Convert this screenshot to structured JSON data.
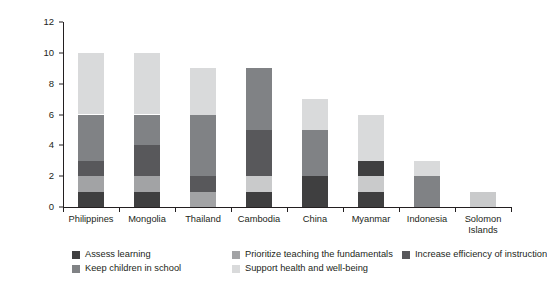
{
  "chart_data": {
    "type": "bar",
    "subtype": "stacked-bar",
    "title": "",
    "xlabel": "",
    "ylabel": "Number of recovery measures, by key area",
    "ylim": [
      0,
      12
    ],
    "yticks": [
      0,
      2,
      4,
      6,
      8,
      10,
      12
    ],
    "grid": false,
    "legend_position": "bottom",
    "categories": [
      "Philippines",
      "Mongolia",
      "Thailand",
      "Cambodia",
      "China",
      "Myanmar",
      "Indonesia",
      "Solomon\nIslands"
    ],
    "series": [
      {
        "name": "Assess learning",
        "color": "#3f3f40",
        "values": [
          1,
          1,
          0,
          1,
          2,
          1,
          0,
          0
        ]
      },
      {
        "name": "Keep children in school",
        "color": "#a2a3a5",
        "values": [
          1,
          1,
          1,
          0,
          0,
          0,
          0,
          0
        ]
      },
      {
        "name": "Prioritize teaching the fundamentals",
        "color": "#c9cacb",
        "values": [
          0,
          0,
          0,
          1,
          0,
          1,
          0,
          1
        ]
      },
      {
        "name": "Increase efficiency of instruction",
        "color": "#58585b",
        "values": [
          1,
          2,
          1,
          3,
          0,
          1,
          0,
          0
        ]
      },
      {
        "name": "Support health and well-being",
        "color": "#808285",
        "values": [
          3,
          2,
          4,
          4,
          3,
          0,
          2,
          0
        ]
      },
      {
        "name": "Support health and well-being (upper)",
        "color": "#d9dadb",
        "values": [
          4,
          4,
          3,
          0,
          2,
          3,
          1,
          0
        ]
      }
    ],
    "stack_order_bottom_to_top": [
      "Assess learning",
      "Keep children in school",
      "Prioritize teaching the fundamentals",
      "Increase efficiency of instruction",
      "Support health and well-being",
      "Support health and well-being (upper)"
    ],
    "totals": [
      10,
      10,
      9,
      9,
      7,
      6,
      3,
      1
    ],
    "bars": [
      {
        "category": "Philippines",
        "total": 10,
        "segments": [
          {
            "label": "Assess learning",
            "from": 0,
            "to": 1,
            "color": "#3f3f40"
          },
          {
            "label": "Keep children in school",
            "from": 1,
            "to": 2,
            "color": "#a2a3a5"
          },
          {
            "label": "Increase efficiency of instruction",
            "from": 2,
            "to": 3,
            "color": "#58585b"
          },
          {
            "label": "Support health and well-being",
            "from": 3,
            "to": 6,
            "color": "#808285"
          },
          {
            "label": "Prioritize teaching the fundamentals",
            "from": 6,
            "to": 10,
            "color": "#d9dadb"
          }
        ]
      },
      {
        "category": "Mongolia",
        "total": 10,
        "segments": [
          {
            "label": "Assess learning",
            "from": 0,
            "to": 1,
            "color": "#3f3f40"
          },
          {
            "label": "Keep children in school",
            "from": 1,
            "to": 2,
            "color": "#a2a3a5"
          },
          {
            "label": "Increase efficiency of instruction",
            "from": 2,
            "to": 4,
            "color": "#58585b"
          },
          {
            "label": "Support health and well-being",
            "from": 4,
            "to": 6,
            "color": "#808285"
          },
          {
            "label": "Prioritize teaching the fundamentals",
            "from": 6,
            "to": 10,
            "color": "#d9dadb"
          }
        ]
      },
      {
        "category": "Thailand",
        "total": 9,
        "segments": [
          {
            "label": "Keep children in school",
            "from": 0,
            "to": 1,
            "color": "#a2a3a5"
          },
          {
            "label": "Increase efficiency of instruction",
            "from": 1,
            "to": 2,
            "color": "#58585b"
          },
          {
            "label": "Support health and well-being",
            "from": 2,
            "to": 6,
            "color": "#808285"
          },
          {
            "label": "Prioritize teaching the fundamentals",
            "from": 6,
            "to": 9,
            "color": "#d9dadb"
          }
        ]
      },
      {
        "category": "Cambodia",
        "total": 9,
        "segments": [
          {
            "label": "Assess learning",
            "from": 0,
            "to": 1,
            "color": "#3f3f40"
          },
          {
            "label": "Prioritize teaching the fundamentals",
            "from": 1,
            "to": 2,
            "color": "#c9cacb"
          },
          {
            "label": "Increase efficiency of instruction",
            "from": 2,
            "to": 5,
            "color": "#58585b"
          },
          {
            "label": "Support health and well-being",
            "from": 5,
            "to": 9,
            "color": "#808285"
          }
        ]
      },
      {
        "category": "China",
        "total": 7,
        "segments": [
          {
            "label": "Assess learning",
            "from": 0,
            "to": 2,
            "color": "#3f3f40"
          },
          {
            "label": "Support health and well-being",
            "from": 2,
            "to": 5,
            "color": "#808285"
          },
          {
            "label": "Prioritize teaching the fundamentals",
            "from": 5,
            "to": 7,
            "color": "#d9dadb"
          }
        ]
      },
      {
        "category": "Myanmar",
        "total": 6,
        "segments": [
          {
            "label": "Assess learning",
            "from": 0,
            "to": 1,
            "color": "#3f3f40"
          },
          {
            "label": "Keep children in school",
            "from": 1,
            "to": 2,
            "color": "#c9cacb"
          },
          {
            "label": "Increase efficiency of instruction",
            "from": 2,
            "to": 3,
            "color": "#3f3f40"
          },
          {
            "label": "Prioritize teaching the fundamentals",
            "from": 3,
            "to": 6,
            "color": "#d9dadb"
          }
        ]
      },
      {
        "category": "Indonesia",
        "total": 3,
        "segments": [
          {
            "label": "Support health and well-being",
            "from": 0,
            "to": 2,
            "color": "#808285"
          },
          {
            "label": "Prioritize teaching the fundamentals",
            "from": 2,
            "to": 3,
            "color": "#d9dadb"
          }
        ]
      },
      {
        "category": "Solomon Islands",
        "total": 1,
        "segments": [
          {
            "label": "Prioritize teaching the fundamentals",
            "from": 0,
            "to": 1,
            "color": "#c9cacb"
          }
        ]
      }
    ],
    "legend": [
      {
        "label": "Assess learning",
        "color": "#3f3f40",
        "row": 0,
        "col": 0
      },
      {
        "label": "Prioritize teaching the fundamentals",
        "color": "#a2a3a5",
        "row": 0,
        "col": 1
      },
      {
        "label": "Increase efficiency of instruction",
        "color": "#58585b",
        "row": 0,
        "col": 2
      },
      {
        "label": "Keep children in school",
        "color": "#808285",
        "row": 1,
        "col": 0
      },
      {
        "label": "Support health and well-being",
        "color": "#d9dadb",
        "row": 1,
        "col": 1
      }
    ]
  },
  "axis": {
    "y_title": "Number of recovery measures, by key area",
    "y_tick_labels": [
      "0",
      "2",
      "4",
      "6",
      "8",
      "10",
      "12"
    ]
  }
}
